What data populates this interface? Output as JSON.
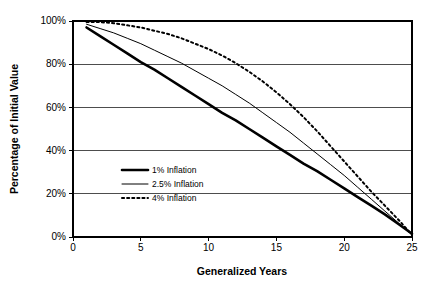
{
  "chart_data": {
    "type": "line",
    "title": "",
    "xlabel": "Generalized Years",
    "ylabel": "Percentage of Initial Value",
    "xlim": [
      0,
      25
    ],
    "ylim": [
      0,
      100
    ],
    "xticks": [
      "0",
      "5",
      "10",
      "15",
      "20",
      "25"
    ],
    "xtick_values": [
      0,
      5,
      10,
      15,
      20,
      25
    ],
    "yticks": [
      "0%",
      "20%",
      "40%",
      "60%",
      "80%",
      "100%"
    ],
    "ytick_values": [
      0,
      20,
      40,
      60,
      80,
      100
    ],
    "grid": "horizontal",
    "legend_position": "center-left-inside",
    "x": [
      1,
      2,
      3,
      4,
      5,
      6,
      7,
      8,
      9,
      10,
      11,
      12,
      13,
      14,
      15,
      16,
      17,
      18,
      19,
      20,
      21,
      22,
      23,
      24,
      25
    ],
    "series": [
      {
        "name": "1% Inflation",
        "style": "solid",
        "width": 2.6,
        "color": "#000000",
        "values": [
          97,
          93,
          89,
          85,
          81,
          77.5,
          73.5,
          69.5,
          65.5,
          61.5,
          57.5,
          54,
          50,
          46,
          42,
          38,
          34,
          30.5,
          26.5,
          22.5,
          18.5,
          14.5,
          10.5,
          6,
          1.5
        ]
      },
      {
        "name": "2.5% Inflation",
        "style": "solid",
        "width": 1,
        "color": "#000000",
        "values": [
          98.5,
          96.5,
          94.5,
          92,
          89.5,
          86.5,
          83.5,
          80.5,
          77,
          73.5,
          70,
          66,
          62,
          57.5,
          53,
          48.5,
          43.5,
          38.5,
          33.5,
          28.5,
          23,
          17.5,
          12,
          6.5,
          1
        ]
      },
      {
        "name": "4% Inflation",
        "style": "dotted",
        "width": 2,
        "color": "#000000",
        "values": [
          99.5,
          99.5,
          99,
          98,
          97,
          95.5,
          94,
          92,
          89.5,
          87,
          84,
          80.5,
          76.5,
          72,
          67,
          61.5,
          55.5,
          49,
          42,
          35,
          28,
          21,
          14.5,
          8,
          1
        ]
      }
    ]
  },
  "legend": {
    "items": [
      {
        "label": "1% Inflation"
      },
      {
        "label": "2.5% Inflation"
      },
      {
        "label": "4% Inflation"
      }
    ]
  }
}
